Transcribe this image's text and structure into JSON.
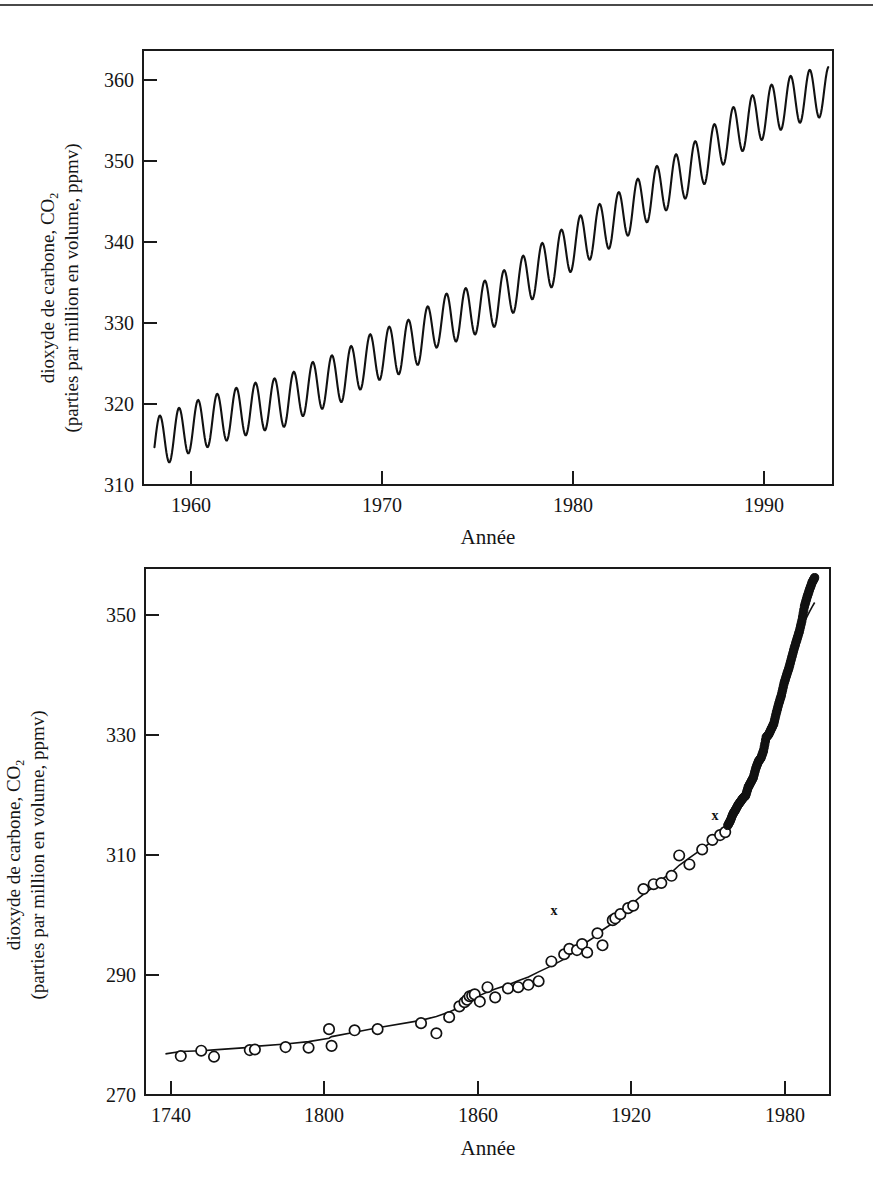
{
  "page": {
    "top_rule": "horizontal-rule",
    "background_color": "#ffffff",
    "ink_color": "#111111"
  },
  "figures": [
    {
      "id": "mauna-loa-monthly",
      "axis_title_x": "Année",
      "axis_title_y_line1": "dioxyde de carbone, CO",
      "axis_title_y_sub1": "2",
      "axis_title_y_line2": "(parties par million en volume, ppmv)",
      "y_ticks": [
        "310",
        "320",
        "330",
        "340",
        "350",
        "360"
      ],
      "x_ticks": [
        "1960",
        "1970",
        "1980",
        "1990"
      ]
    },
    {
      "id": "ice-core-and-modern",
      "axis_title_x": "Année",
      "axis_title_y_line1": "dioxyde de carbone, CO",
      "axis_title_y_sub1": "2",
      "axis_title_y_line2": "(parties par million en volume, ppmv)",
      "y_ticks": [
        "270",
        "290",
        "310",
        "330",
        "350"
      ],
      "x_ticks": [
        "1740",
        "1800",
        "1860",
        "1920",
        "1980"
      ],
      "annotations": [
        {
          "label": "x",
          "year": 1890,
          "value": 298
        },
        {
          "label": "x",
          "year": 1953,
          "value": 314
        }
      ]
    }
  ],
  "chart_data": [
    {
      "type": "line",
      "id": "mauna-loa-monthly",
      "title": "",
      "xlabel": "Année",
      "ylabel": "dioxyde de carbone, CO2 (parties par million en volume, ppmv)",
      "xlim": [
        1957.5,
        1993.6
      ],
      "ylim": [
        310,
        362
      ],
      "grid": false,
      "legend": "none",
      "description": "Courbe de Keeling: concentration mensuelle de CO2 mesurée à Mauna Loa, dent de scie saisonnière superposée à une tendance croissante.",
      "seasonal_amplitude_ppmv": 6.0,
      "annual_trend": {
        "x": [
          1958,
          1959,
          1960,
          1961,
          1962,
          1963,
          1964,
          1965,
          1966,
          1967,
          1968,
          1969,
          1970,
          1971,
          1972,
          1973,
          1974,
          1975,
          1976,
          1977,
          1978,
          1979,
          1980,
          1981,
          1982,
          1983,
          1984,
          1985,
          1986,
          1987,
          1988,
          1989,
          1990,
          1991,
          1992,
          1993
        ],
        "y": [
          315.0,
          315.8,
          316.9,
          317.6,
          318.4,
          319.0,
          319.6,
          320.0,
          321.4,
          322.2,
          323.0,
          324.6,
          325.7,
          326.3,
          327.5,
          329.7,
          330.2,
          331.1,
          332.0,
          333.8,
          335.4,
          336.8,
          338.7,
          340.1,
          341.4,
          343.0,
          344.6,
          346.0,
          347.4,
          349.2,
          351.6,
          353.1,
          354.4,
          355.6,
          356.4,
          357.0
        ]
      }
    },
    {
      "type": "scatter",
      "id": "ice-core-and-modern",
      "title": "",
      "xlabel": "Année",
      "ylabel": "dioxyde de carbone, CO2 (parties par million en volume, ppmv)",
      "xlim": [
        1730,
        1998
      ],
      "ylim": [
        270,
        358
      ],
      "grid": false,
      "legend": "none",
      "description": "Concentrations de CO2 issues de carottes de glace (cercles ouverts) et mesures atmosphériques directes (points pleins), avec courbe ajustée.",
      "series": [
        {
          "name": "carottes de glace (cercles ouverts)",
          "marker": "open-circle",
          "points": [
            [
              1744,
              276.5
            ],
            [
              1752,
              277.4
            ],
            [
              1757,
              276.4
            ],
            [
              1771,
              277.5
            ],
            [
              1773,
              277.6
            ],
            [
              1785,
              278.0
            ],
            [
              1794,
              277.9
            ],
            [
              1802,
              281.0
            ],
            [
              1803,
              278.2
            ],
            [
              1812,
              280.8
            ],
            [
              1821,
              281.0
            ],
            [
              1838,
              282.0
            ],
            [
              1844,
              280.3
            ],
            [
              1849,
              283.0
            ],
            [
              1853,
              284.8
            ],
            [
              1855,
              285.5
            ],
            [
              1856,
              285.9
            ],
            [
              1857,
              286.5
            ],
            [
              1858,
              286.6
            ],
            [
              1859,
              286.8
            ],
            [
              1861,
              285.6
            ],
            [
              1864,
              288.0
            ],
            [
              1867,
              286.3
            ],
            [
              1872,
              287.8
            ],
            [
              1876,
              288.0
            ],
            [
              1880,
              288.4
            ],
            [
              1884,
              289.0
            ],
            [
              1889,
              292.3
            ],
            [
              1894,
              293.5
            ],
            [
              1896,
              294.4
            ],
            [
              1899,
              294.2
            ],
            [
              1901,
              295.2
            ],
            [
              1903,
              293.8
            ],
            [
              1907,
              297.0
            ],
            [
              1909,
              295.0
            ],
            [
              1913,
              299.2
            ],
            [
              1914,
              299.5
            ],
            [
              1916,
              300.2
            ],
            [
              1919,
              301.2
            ],
            [
              1921,
              301.6
            ],
            [
              1925,
              304.4
            ],
            [
              1929,
              305.2
            ],
            [
              1932,
              305.4
            ],
            [
              1936,
              306.6
            ],
            [
              1939,
              310.0
            ],
            [
              1943,
              308.5
            ],
            [
              1948,
              311.0
            ],
            [
              1952,
              312.6
            ],
            [
              1955,
              313.4
            ],
            [
              1957,
              313.9
            ]
          ]
        },
        {
          "name": "mesures atmosphériques directes (points pleins)",
          "marker": "filled-circle",
          "points": [
            [
              1958,
              315.0
            ],
            [
              1959,
              315.8
            ],
            [
              1960,
              316.9
            ],
            [
              1961,
              317.6
            ],
            [
              1962,
              318.4
            ],
            [
              1963,
              319.0
            ],
            [
              1964,
              319.6
            ],
            [
              1965,
              320.0
            ],
            [
              1966,
              321.4
            ],
            [
              1967,
              322.2
            ],
            [
              1968,
              323.0
            ],
            [
              1969,
              324.6
            ],
            [
              1970,
              325.7
            ],
            [
              1971,
              326.3
            ],
            [
              1972,
              327.5
            ],
            [
              1973,
              329.7
            ],
            [
              1974,
              330.2
            ],
            [
              1975,
              331.1
            ],
            [
              1976,
              332.0
            ],
            [
              1977,
              333.8
            ],
            [
              1978,
              335.4
            ],
            [
              1979,
              336.8
            ],
            [
              1980,
              338.7
            ],
            [
              1981,
              340.1
            ],
            [
              1982,
              341.4
            ],
            [
              1983,
              343.0
            ],
            [
              1984,
              344.6
            ],
            [
              1985,
              346.0
            ],
            [
              1986,
              347.4
            ],
            [
              1987,
              349.2
            ],
            [
              1988,
              351.6
            ],
            [
              1989,
              353.1
            ],
            [
              1990,
              354.4
            ],
            [
              1991,
              355.6
            ],
            [
              1992,
              356.4
            ]
          ]
        }
      ]
    }
  ]
}
